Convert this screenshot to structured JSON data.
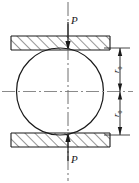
{
  "figure": {
    "type": "engineering-diagram",
    "labels": {
      "force_top": "P",
      "force_bottom": "P",
      "radius_top": "r",
      "radius_top_sub": "0",
      "radius_bottom": "r",
      "radius_bottom_sub": "0"
    },
    "colors": {
      "line": "#1a1a1a",
      "hatch": "#1a1a1a",
      "centerline": "#8a8a8a",
      "background": "#ffffff"
    },
    "geometry": {
      "circle": {
        "cx": 60,
        "cy": 91.5,
        "r": 43.5
      },
      "top_block": {
        "x": 11,
        "y": 36,
        "width": 99,
        "height": 14
      },
      "bottom_block": {
        "x": 11,
        "y": 133,
        "width": 99,
        "height": 14
      },
      "dimension_line_x": 120,
      "dimension_top_y": 48,
      "dimension_mid_y": 91.5,
      "dimension_bottom_y": 135,
      "axis_x": 68,
      "axis_top_y": 2,
      "axis_bottom_y": 181
    }
  }
}
